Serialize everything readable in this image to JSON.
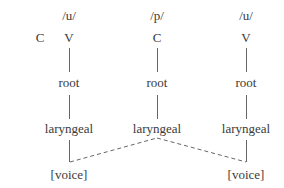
{
  "diagram": {
    "type": "feature-geometry tree",
    "standalone_consonant": "C",
    "columns": [
      {
        "phoneme": "/u/",
        "segment": "V",
        "root": "root",
        "laryngeal": "laryngeal",
        "feature": "[voice]"
      },
      {
        "phoneme": "/p/",
        "segment": "C",
        "root": "root",
        "laryngeal": "laryngeal",
        "feature": ""
      },
      {
        "phoneme": "/u/",
        "segment": "V",
        "root": "root",
        "laryngeal": "laryngeal",
        "feature": "[voice]"
      }
    ],
    "edges": [
      {
        "from": "col0.segment",
        "to": "col0.root",
        "style": "solid"
      },
      {
        "from": "col0.root",
        "to": "col0.laryngeal",
        "style": "solid"
      },
      {
        "from": "col0.laryngeal",
        "to": "col0.feature",
        "style": "solid"
      },
      {
        "from": "col1.segment",
        "to": "col1.root",
        "style": "solid"
      },
      {
        "from": "col1.root",
        "to": "col1.laryngeal",
        "style": "solid"
      },
      {
        "from": "col2.segment",
        "to": "col2.root",
        "style": "solid"
      },
      {
        "from": "col2.root",
        "to": "col2.laryngeal",
        "style": "solid"
      },
      {
        "from": "col2.laryngeal",
        "to": "col2.feature",
        "style": "solid"
      },
      {
        "from": "col1.laryngeal",
        "to": "col0.feature",
        "style": "dashed"
      },
      {
        "from": "col1.laryngeal",
        "to": "col2.feature",
        "style": "dashed"
      }
    ]
  }
}
